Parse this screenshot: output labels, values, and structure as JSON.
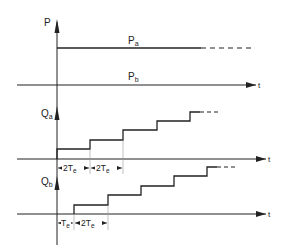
{
  "diagram": {
    "type": "timing-diagram",
    "colors": {
      "line": "#222222",
      "background": "#ffffff"
    },
    "panel_p": {
      "axis_label": "P",
      "time_label": "t",
      "series": [
        {
          "name": "Pa",
          "label_main": "P",
          "label_sub": "a",
          "level": "high",
          "style": "solid-then-dashed"
        },
        {
          "name": "Pb",
          "label_main": "P",
          "label_sub": "b",
          "level": "zero",
          "style": "on-axis"
        }
      ]
    },
    "panel_qa": {
      "axis_label_main": "Q",
      "axis_label_sub": "a",
      "time_label": "t",
      "start_delay": "0",
      "step_interval": "2Te",
      "dimensions": [
        {
          "label_main": "2T",
          "label_sub": "e"
        },
        {
          "label_main": "2T",
          "label_sub": "e"
        }
      ]
    },
    "panel_qb": {
      "axis_label_main": "Q",
      "axis_label_sub": "b",
      "time_label": "t",
      "start_delay": "Te",
      "step_interval": "2Te",
      "dimensions": [
        {
          "label_main": "T",
          "label_sub": "e"
        },
        {
          "label_main": "2T",
          "label_sub": "e"
        }
      ]
    }
  }
}
